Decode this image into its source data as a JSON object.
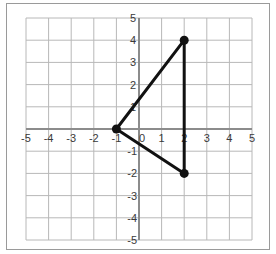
{
  "chart_data": {
    "type": "scatter",
    "title": "",
    "xlabel": "",
    "ylabel": "",
    "xlim": [
      -5,
      5
    ],
    "ylim": [
      -5,
      5
    ],
    "grid": true,
    "legend": null,
    "x_ticks": [
      "-5",
      "-4",
      "-3",
      "-2",
      "-1",
      "0",
      "1",
      "2",
      "3",
      "4",
      "5"
    ],
    "y_ticks": [
      "5",
      "4",
      "3",
      "2",
      "1",
      "0",
      "-1",
      "-2",
      "-3",
      "-4",
      "-5"
    ],
    "series": [
      {
        "name": "triangle",
        "shape": "closed-polygon",
        "points": [
          {
            "x": -1,
            "y": 0
          },
          {
            "x": 2,
            "y": 4
          },
          {
            "x": 2,
            "y": -2
          }
        ]
      }
    ]
  },
  "axis": {
    "x_labels": [
      "-5",
      "-4",
      "-3",
      "-2",
      "-1",
      "0",
      "1",
      "2",
      "3",
      "4",
      "5"
    ],
    "y_labels_pos": [
      "5",
      "4",
      "3",
      "2",
      "1"
    ],
    "y_labels_neg": [
      "-1",
      "-2",
      "-3",
      "-4",
      "-5"
    ],
    "origin_label": "0"
  },
  "colors": {
    "grid": "#b8b8b8",
    "axis": "#8c8c8c",
    "triangle": "#111111",
    "frame": "#9a9a9a",
    "label": "#3a3a3a"
  }
}
